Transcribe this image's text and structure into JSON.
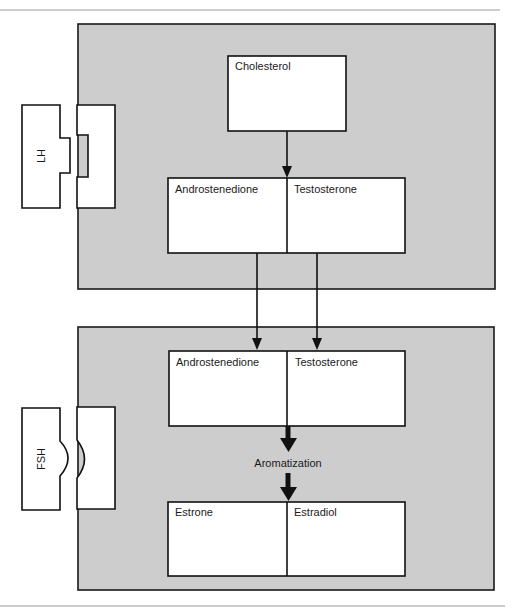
{
  "diagram": {
    "type": "steroidogenesis two-cell model",
    "colors": {
      "panel_fill": "#cdcdcd",
      "box_fill": "#ffffff",
      "stroke": "#111111"
    },
    "upper_cell": {
      "receptor": {
        "label": "LH",
        "shape": "rectangular notch"
      },
      "nodes": {
        "cholesterol": "Cholesterol",
        "androstenedione": "Androstenedione",
        "testosterone": "Testosterone"
      }
    },
    "lower_cell": {
      "receptor": {
        "label": "FSH",
        "shape": "rounded notch"
      },
      "nodes": {
        "androstenedione": "Androstenedione",
        "testosterone": "Testosterone",
        "estrone": "Estrone",
        "estradiol": "Estradiol"
      },
      "process_label": "Aromatization"
    },
    "edges": [
      {
        "from": "Cholesterol",
        "to": "Androstenedione/Testosterone (upper)"
      },
      {
        "from": "Androstenedione (upper)",
        "to": "Androstenedione (lower)"
      },
      {
        "from": "Testosterone (upper)",
        "to": "Testosterone (lower)"
      },
      {
        "from": "Androstenedione/Testosterone (lower)",
        "to": "Estrone/Estradiol",
        "label": "Aromatization"
      }
    ]
  }
}
